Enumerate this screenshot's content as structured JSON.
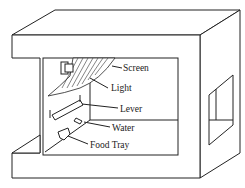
{
  "diagram": {
    "labels": [
      {
        "id": "screen",
        "text": "Screen"
      },
      {
        "id": "light",
        "text": "Light"
      },
      {
        "id": "lever",
        "text": "Lever"
      },
      {
        "id": "water",
        "text": "Water"
      },
      {
        "id": "food_tray",
        "text": "Food Tray"
      }
    ],
    "colors": {
      "stroke": "#222222",
      "background": "#ffffff"
    }
  }
}
